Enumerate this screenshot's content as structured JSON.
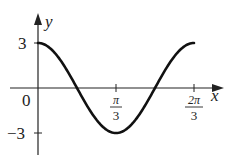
{
  "chart_data": {
    "type": "line",
    "title": "",
    "function": "y = 3cos(3x)",
    "xlabel": "x",
    "ylabel": "y",
    "x_ticks": [
      {
        "value": 1.0472,
        "label": "π/3",
        "num": "π",
        "den": "3"
      },
      {
        "value": 2.0944,
        "label": "2π/3",
        "num": "2π",
        "den": "3"
      }
    ],
    "y_ticks": [
      {
        "value": 3,
        "label": "3"
      },
      {
        "value": -3,
        "label": "−3"
      }
    ],
    "origin_label": "0",
    "xlim": [
      0,
      2.0944
    ],
    "ylim": [
      -3,
      3
    ],
    "grid": false,
    "legend": null,
    "series": [
      {
        "name": "y = 3cos(3x)",
        "x": [
          0,
          0.2618,
          0.5236,
          0.7854,
          1.0472,
          1.309,
          1.5708,
          1.8326,
          2.0944
        ],
        "y": [
          3,
          2.12,
          0,
          -2.12,
          -3,
          -2.12,
          0,
          2.12,
          3
        ]
      }
    ]
  }
}
